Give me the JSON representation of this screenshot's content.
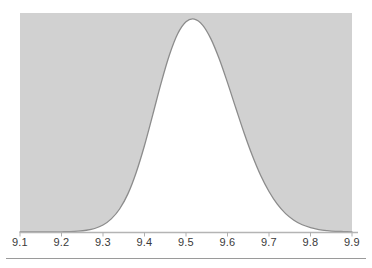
{
  "figure": {
    "background_color": "#ffffff",
    "width": 372,
    "height": 268
  },
  "chart_data": {
    "type": "area",
    "title": "",
    "subtitle": "",
    "xlabel": "",
    "ylabel": "",
    "curve_name": "normal-density-curve",
    "distribution": "normal",
    "mean": 9.5,
    "std_dev": 0.1,
    "xlim": [
      9.1,
      9.9
    ],
    "ylim": [
      0,
      1.0
    ],
    "grid": false,
    "legend": false,
    "legend_position": "none",
    "xticks": [
      9.1,
      9.2,
      9.3,
      9.4,
      9.5,
      9.6,
      9.7,
      9.8,
      9.9
    ],
    "xtick_labels": [
      "9.1",
      "9.2",
      "9.3",
      "9.4",
      "9.5",
      "9.6",
      "9.7",
      "9.8",
      "9.9"
    ],
    "yticks": [],
    "ytick_labels": [],
    "x": [
      9.1,
      9.12,
      9.14,
      9.16,
      9.18,
      9.2,
      9.22,
      9.24,
      9.26,
      9.28,
      9.3,
      9.32,
      9.34,
      9.36,
      9.38,
      9.4,
      9.42,
      9.44,
      9.46,
      9.48,
      9.5,
      9.52,
      9.54,
      9.56,
      9.58,
      9.6,
      9.62,
      9.64,
      9.66,
      9.68,
      9.7,
      9.72,
      9.74,
      9.76,
      9.78,
      9.8,
      9.82,
      9.84,
      9.86,
      9.88,
      9.9
    ],
    "y": [
      0.0,
      0.0,
      0.0,
      0.0,
      0.0,
      0.001,
      0.002,
      0.004,
      0.008,
      0.016,
      0.032,
      0.06,
      0.105,
      0.174,
      0.272,
      0.395,
      0.536,
      0.68,
      0.808,
      0.905,
      0.96,
      0.972,
      0.945,
      0.882,
      0.791,
      0.682,
      0.566,
      0.452,
      0.348,
      0.258,
      0.185,
      0.127,
      0.084,
      0.054,
      0.033,
      0.02,
      0.011,
      0.006,
      0.003,
      0.002,
      0.001
    ],
    "fill_above_curve_color": "#d1d1d1",
    "fill_under_curve_color": "#ffffff",
    "curve_stroke_color": "#8c8c8c",
    "axis_color": "#b0b0b0",
    "tick_color": "#b0b0b0",
    "rule_color": "#9a9a9a"
  },
  "axis": {
    "name": "x-axis",
    "line_label": "horizontal-axis-line",
    "ticks": [
      {
        "label": "9.1",
        "value": 9.1,
        "x": 20
      },
      {
        "label": "9.2",
        "value": 9.2,
        "x": 61.5
      },
      {
        "label": "9.3",
        "value": 9.3,
        "x": 103
      },
      {
        "label": "9.4",
        "value": 9.4,
        "x": 144.5
      },
      {
        "label": "9.5",
        "value": 9.5,
        "x": 186
      },
      {
        "label": "9.6",
        "value": 9.6,
        "x": 227.5
      },
      {
        "label": "9.7",
        "value": 9.7,
        "x": 269
      },
      {
        "label": "9.8",
        "value": 9.8,
        "x": 310.5
      },
      {
        "label": "9.9",
        "value": 9.9,
        "x": 352
      }
    ]
  },
  "footer": {
    "rule_name": "bottom-horizontal-rule"
  }
}
